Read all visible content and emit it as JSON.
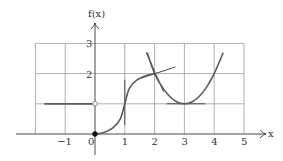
{
  "chart_data": {
    "type": "line",
    "title": "",
    "xlabel": "x",
    "ylabel": "f(x)",
    "xlim": [
      -2,
      5
    ],
    "ylim": [
      0,
      3
    ],
    "grid": true,
    "x_ticks": [
      {
        "value": -1,
        "label": "−1"
      },
      {
        "value": 0,
        "label": "0"
      },
      {
        "value": 1,
        "label": "1"
      },
      {
        "value": 2,
        "label": "2"
      },
      {
        "value": 3,
        "label": "3"
      },
      {
        "value": 4,
        "label": "4"
      },
      {
        "value": 5,
        "label": "5"
      }
    ],
    "y_ticks": [
      {
        "value": 2,
        "label": "2"
      },
      {
        "value": 3,
        "label": "3"
      }
    ],
    "series": [
      {
        "name": "constant-segment",
        "kind": "segment",
        "points": [
          [
            -1.7,
            1
          ],
          [
            0,
            1
          ]
        ]
      },
      {
        "name": "s-curve",
        "kind": "curve",
        "points": [
          [
            0,
            0
          ],
          [
            0.3,
            0.05
          ],
          [
            0.6,
            0.2
          ],
          [
            0.85,
            0.5
          ],
          [
            1,
            1
          ],
          [
            1.15,
            1.5
          ],
          [
            1.4,
            1.78
          ],
          [
            1.7,
            1.93
          ],
          [
            2,
            2
          ]
        ]
      },
      {
        "name": "parabola",
        "kind": "curve",
        "points": [
          [
            1.75,
            2.7
          ],
          [
            2,
            2
          ],
          [
            2.25,
            1.56
          ],
          [
            2.5,
            1.25
          ],
          [
            2.75,
            1.06
          ],
          [
            3,
            1
          ],
          [
            3.25,
            1.06
          ],
          [
            3.5,
            1.25
          ],
          [
            3.75,
            1.56
          ],
          [
            4,
            2
          ],
          [
            4.3,
            2.69
          ]
        ]
      }
    ],
    "tangent_lines": [
      {
        "name": "vertical-tangent-at-1",
        "points": [
          [
            1,
            0.3
          ],
          [
            1,
            1.8
          ]
        ]
      },
      {
        "name": "left-tangent-at-2",
        "points": [
          [
            1.4,
            1.8
          ],
          [
            2.7,
            2.22
          ]
        ]
      },
      {
        "name": "right-tangent-at-2",
        "points": [
          [
            1.72,
            2.7
          ],
          [
            2.3,
            1.4
          ]
        ]
      },
      {
        "name": "horizontal-tangent-at-3",
        "points": [
          [
            2.4,
            1
          ],
          [
            3.7,
            1
          ]
        ]
      }
    ],
    "markers": [
      {
        "name": "open-circle",
        "x": 0,
        "y": 1,
        "filled": false
      },
      {
        "name": "filled-dot",
        "x": 0,
        "y": 0,
        "filled": true
      }
    ]
  }
}
